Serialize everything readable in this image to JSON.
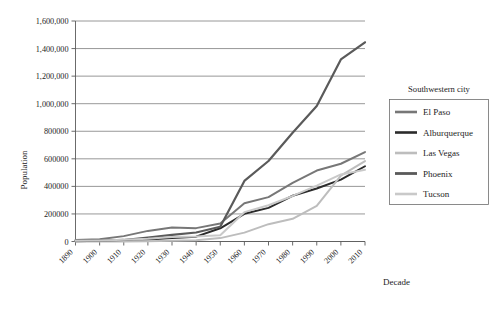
{
  "chart_data": {
    "type": "line",
    "title": "",
    "xlabel": "Decade",
    "ylabel": "Population",
    "categories": [
      "1890",
      "1900",
      "1910",
      "1920",
      "1930",
      "1940",
      "1950",
      "1960",
      "1970",
      "1980",
      "1990",
      "2000",
      "2010"
    ],
    "x": [
      1890,
      1900,
      1910,
      1920,
      1930,
      1940,
      1950,
      1960,
      1970,
      1980,
      1990,
      2000,
      2010
    ],
    "xlim": [
      1890,
      2010
    ],
    "ylim": [
      0,
      1600000
    ],
    "ytick_labels": [
      "0",
      "200000",
      "400000",
      "600000",
      "800000",
      "1,000,000",
      "1,200,000",
      "1,400,000",
      "1,600,000"
    ],
    "ytick_values": [
      0,
      200000,
      400000,
      600000,
      800000,
      1000000,
      1200000,
      1400000,
      1600000
    ],
    "grid": true,
    "legend_position": "right",
    "legend_title": "Southwestern city",
    "series": [
      {
        "name": "El Paso",
        "color": "#777777",
        "width": 2.0,
        "values": [
          10000,
          16000,
          39000,
          77000,
          102000,
          97000,
          130000,
          277000,
          322000,
          425000,
          515000,
          564000,
          649000
        ]
      },
      {
        "name": "Alburquerque",
        "color": "#2b2b2b",
        "width": 2.0,
        "values": [
          3800,
          6200,
          11000,
          15000,
          26000,
          35000,
          96000,
          201000,
          244000,
          332000,
          385000,
          449000,
          546000
        ]
      },
      {
        "name": "Las Vegas",
        "color": "#bdbdbd",
        "width": 2.0,
        "values": [
          0,
          0,
          800,
          2300,
          5100,
          8400,
          24600,
          64400,
          125800,
          164700,
          258300,
          478400,
          583800
        ]
      },
      {
        "name": "Phoenix",
        "color": "#5a5a5a",
        "width": 2.2,
        "values": [
          3100,
          5500,
          11100,
          29000,
          48100,
          65400,
          106800,
          439200,
          584300,
          789700,
          983400,
          1321000,
          1445600
        ]
      },
      {
        "name": "Tucson",
        "color": "#c9c9c9",
        "width": 2.0,
        "values": [
          5100,
          7500,
          13100,
          20300,
          32500,
          36800,
          45500,
          212900,
          262900,
          330500,
          405400,
          486700,
          520100
        ]
      }
    ]
  },
  "axis": {
    "y_title": "Population",
    "x_title": "Decade"
  },
  "legend": {
    "title": "Southwestern city"
  }
}
